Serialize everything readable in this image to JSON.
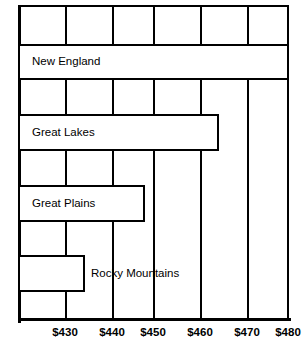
{
  "chart_data": {
    "type": "bar",
    "orientation": "horizontal",
    "title": "",
    "subtitle": "",
    "xlabel": "",
    "ylabel": "",
    "categories": [
      "New England",
      "Great Lakes",
      "Great Plains",
      "Rocky Mountains"
    ],
    "values": [
      480,
      464,
      448,
      434
    ],
    "value_prefix": "$",
    "xlim": [
      420,
      480
    ],
    "ylim": null,
    "grid": true,
    "grid_axis": "x",
    "legend": null,
    "legend_position": "none",
    "tick_labels": [
      "$430",
      "$440",
      "$450",
      "$460",
      "$470",
      "$480"
    ],
    "tick_values": [
      430,
      440,
      450,
      460,
      470,
      480
    ],
    "annotations": [],
    "bar_fill_color": "#ffffff",
    "bar_edge_color": "#000000",
    "axis_color": "#000000",
    "background_color": "#ffffff"
  },
  "bars": [
    {
      "label": "New England",
      "value": 480,
      "label_placement": "inside",
      "left_px": 18,
      "width_px": 271,
      "top_px": 44,
      "height_px": 36,
      "label_left_px": 0
    },
    {
      "label": "Great Lakes",
      "value": 464,
      "label_placement": "inside",
      "left_px": 18,
      "width_px": 201,
      "top_px": 114,
      "height_px": 37,
      "label_left_px": 0
    },
    {
      "label": "Great Plains",
      "value": 448,
      "label_placement": "inside",
      "left_px": 18,
      "width_px": 127,
      "top_px": 185,
      "height_px": 37,
      "label_left_px": 0
    },
    {
      "label": "Rocky Mountains",
      "value": 434,
      "label_placement": "outside",
      "left_px": 18,
      "width_px": 67,
      "top_px": 255,
      "height_px": 37,
      "label_left_px": 91
    }
  ],
  "gridlines": [
    {
      "label": "$430",
      "value": 430,
      "x_px": 65
    },
    {
      "label": "$440",
      "value": 440,
      "x_px": 112
    },
    {
      "label": "$450",
      "value": 450,
      "x_px": 153
    },
    {
      "label": "$460",
      "value": 460,
      "x_px": 200
    },
    {
      "label": "$470",
      "value": 470,
      "x_px": 247
    },
    {
      "label": "$480",
      "value": 480,
      "x_px": 288
    }
  ]
}
